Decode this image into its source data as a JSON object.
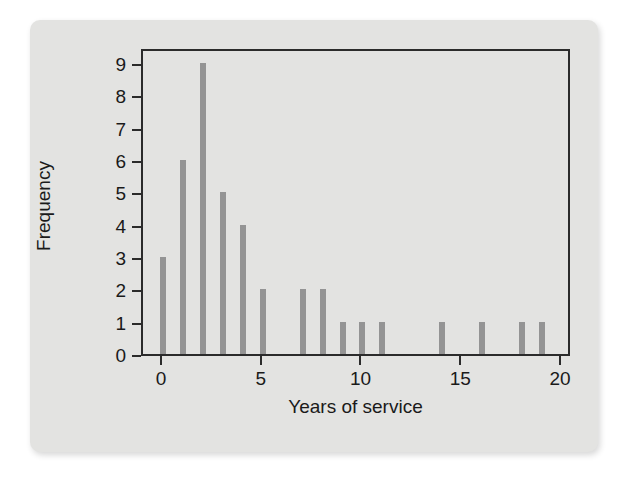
{
  "figure": {
    "background_color": "#e3e3e1",
    "page_color": "#ffffff",
    "bar_color": "#949494",
    "axis_color": "#2b2b2b"
  },
  "chart_data": {
    "type": "bar",
    "title": "",
    "xlabel": "Years of service",
    "ylabel": "Frequency",
    "xlim": [
      -1,
      20.5
    ],
    "ylim": [
      0,
      9.5
    ],
    "grid": false,
    "legend": null,
    "xticks": [
      0,
      5,
      10,
      15,
      20
    ],
    "xtick_labels": [
      "0",
      "5",
      "10",
      "15",
      "20"
    ],
    "yticks": [
      0,
      1,
      2,
      3,
      4,
      5,
      6,
      7,
      8,
      9
    ],
    "ytick_labels": [
      "0",
      "1",
      "2",
      "3",
      "4",
      "5",
      "6",
      "7",
      "8",
      "9"
    ],
    "categories": [
      0,
      1,
      2,
      3,
      4,
      5,
      6,
      7,
      8,
      9,
      10,
      11,
      12,
      13,
      14,
      15,
      16,
      17,
      18,
      19
    ],
    "values": [
      3,
      6,
      9,
      5,
      4,
      2,
      0,
      2,
      2,
      1,
      1,
      1,
      0,
      0,
      1,
      0,
      1,
      0,
      1,
      1
    ]
  }
}
